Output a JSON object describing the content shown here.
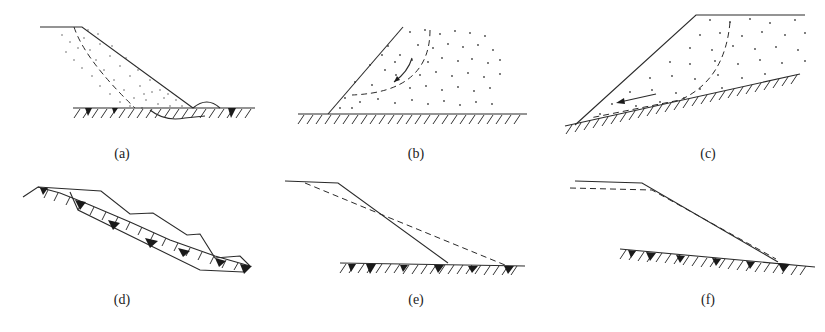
{
  "figure": {
    "caption": "",
    "panels": [
      {
        "id": "a",
        "label": "(a)",
        "description": "Shallow arc slip in slope fill; slip surface exits beyond toe with bulge on ground surface"
      },
      {
        "id": "b",
        "label": "(b)",
        "description": "Circular slip within granular (dotted) fill body, arrow showing movement direction"
      },
      {
        "id": "c",
        "label": "(c)",
        "description": "Fill on sloping ground sliding along base contact, arrow shows sliding direction"
      },
      {
        "id": "d",
        "label": "(d)",
        "description": "Stepped slope mass sliding along inclined bedrock surface"
      },
      {
        "id": "e",
        "label": "(e)",
        "description": "Original slope (solid) and flattened slope after deformation (dashed)"
      },
      {
        "id": "f",
        "label": "(f)",
        "description": "Original slope (solid) and slightly settled slope profile (dashed)"
      }
    ]
  },
  "colors": {
    "line": "#2a2a2a",
    "background": "#ffffff"
  }
}
